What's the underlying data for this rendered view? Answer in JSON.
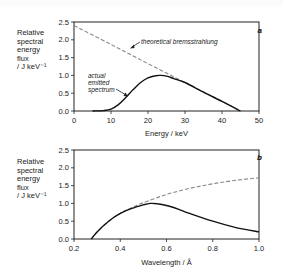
{
  "chart_data": [
    {
      "type": "line",
      "panel": "a",
      "title": "",
      "xlabel": "Energy / keV",
      "ylabel": "Relative spectral energy flux / J keV-1",
      "ylabel_lines": [
        "Relative",
        "spectral",
        "energy",
        "flux",
        "/ J keV⁻¹"
      ],
      "xlim": [
        0,
        50
      ],
      "ylim": [
        0,
        2.5
      ],
      "xticks": [
        "0",
        "10",
        "20",
        "30",
        "40",
        "50"
      ],
      "yticks": [
        "0.0",
        "0.5",
        "1.0",
        "1.5",
        "2.0",
        "2.5"
      ],
      "grid": false,
      "series": [
        {
          "name": "theoretical bremsstrahlung",
          "style": "dashed",
          "x": [
            0,
            10,
            20,
            30,
            40,
            45
          ],
          "y": [
            2.4,
            1.87,
            1.33,
            0.8,
            0.27,
            0.0
          ]
        },
        {
          "name": "actual emitted spectrum",
          "style": "solid",
          "x": [
            5,
            8,
            10,
            12,
            14,
            16,
            18,
            20,
            22,
            23.5,
            25,
            27,
            30,
            35,
            40,
            45
          ],
          "y": [
            0.0,
            0.01,
            0.05,
            0.18,
            0.38,
            0.6,
            0.8,
            0.93,
            0.99,
            1.0,
            0.98,
            0.91,
            0.8,
            0.53,
            0.27,
            0.0
          ]
        }
      ],
      "annotations": [
        "theoretical bremsstrahlung",
        "actual emitted spectrum"
      ]
    },
    {
      "type": "line",
      "panel": "b",
      "title": "",
      "xlabel": "Wavelength / Å",
      "ylabel": "Relative spectral energy flux / J keV-1",
      "ylabel_lines": [
        "Relative",
        "spectral",
        "energy",
        "flux",
        "/ J keV⁻¹"
      ],
      "xlim": [
        0.2,
        1.0
      ],
      "ylim": [
        0,
        2.5
      ],
      "xticks": [
        "0.2",
        "0.4",
        "0.6",
        "0.8",
        "1.0"
      ],
      "yticks": [
        "0.0",
        "0.5",
        "1.0",
        "1.5",
        "2.0",
        "2.5"
      ],
      "grid": false,
      "series": [
        {
          "name": "theoretical bremsstrahlung",
          "style": "dashed",
          "x": [
            0.275,
            0.3,
            0.35,
            0.4,
            0.45,
            0.5,
            0.6,
            0.7,
            0.8,
            0.9,
            1.0
          ],
          "y": [
            0.0,
            0.2,
            0.5,
            0.72,
            0.88,
            1.02,
            1.25,
            1.42,
            1.55,
            1.65,
            1.72
          ]
        },
        {
          "name": "actual emitted spectrum",
          "style": "solid",
          "x": [
            0.275,
            0.3,
            0.35,
            0.4,
            0.45,
            0.5,
            0.53,
            0.56,
            0.6,
            0.65,
            0.7,
            0.8,
            0.9,
            1.0
          ],
          "y": [
            0.0,
            0.2,
            0.5,
            0.72,
            0.86,
            0.96,
            1.0,
            0.99,
            0.94,
            0.84,
            0.72,
            0.5,
            0.32,
            0.2
          ]
        }
      ],
      "annotations": []
    }
  ]
}
